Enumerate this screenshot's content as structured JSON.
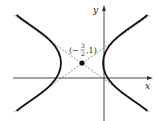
{
  "figure": {
    "type": "hyperbola",
    "center": {
      "x": -1.5,
      "y": 1
    },
    "center_label": "(−3/2, 1)",
    "center_label_parts": {
      "open": "(−",
      "num": "3",
      "den": "2",
      "rest": ",1)"
    },
    "axis_labels": {
      "x": "x",
      "y": "y"
    },
    "orientation": "horizontal transverse axis",
    "asymptotes": "dashed lines through center",
    "colors": {
      "curve": "#111111",
      "asymptote": "#777777",
      "axis": "#333333"
    }
  }
}
